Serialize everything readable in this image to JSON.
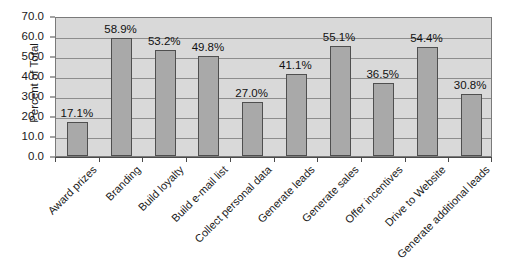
{
  "chart_data": {
    "type": "bar",
    "title": "",
    "xlabel": "",
    "ylabel": "Percent of Total",
    "ylim": [
      0,
      70
    ],
    "ytick_step": 10,
    "grid": true,
    "legend": "none",
    "orientation": "vertical",
    "xtick_rotation": -45,
    "categories": [
      "Award prizes",
      "Branding",
      "Build loyalty",
      "Build e-mail list",
      "Collect personal data",
      "Generate leads",
      "Generate sales",
      "Offer incentives",
      "Drive to Website",
      "Generate additional leads"
    ],
    "values": [
      17.1,
      58.9,
      53.2,
      49.8,
      27.0,
      41.1,
      55.1,
      36.5,
      54.4,
      30.8
    ],
    "value_labels": [
      "17.1%",
      "58.9%",
      "53.2%",
      "49.8%",
      "27.0%",
      "41.1%",
      "55.1%",
      "36.5%",
      "54.4%",
      "30.8%"
    ],
    "ytick_labels": [
      "0.0",
      "10.0",
      "20.0",
      "30.0",
      "40.0",
      "50.0",
      "60.0",
      "70.0"
    ],
    "ytick_values": [
      0,
      10,
      20,
      30,
      40,
      50,
      60,
      70
    ],
    "colors": {
      "bar_fill": "#a9a9a9",
      "bar_border": "#4f4f4f",
      "plot_background": "#d9d9d9",
      "gridline": "#8d8d8d",
      "axis": "#4a4a4a",
      "text": "#1a1a1a",
      "page_background": "#ffffff"
    }
  }
}
